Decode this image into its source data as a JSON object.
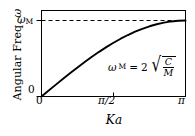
{
  "chart_data": {
    "type": "line",
    "title": "",
    "xlabel": "Ka",
    "ylabel": "Angular Freq. ω",
    "ylabel_text": "Angular Freq.",
    "ylabel_symbol": "ω",
    "xlim": [
      0,
      3.14159
    ],
    "ylim": [
      0,
      1
    ],
    "grid": false,
    "legend": null,
    "xticks": [
      {
        "value": 0,
        "label": "0"
      },
      {
        "value": 1.5708,
        "label": "π/2"
      },
      {
        "value": 3.14159,
        "label": "π"
      }
    ],
    "yticks": [
      {
        "value": 0,
        "label": "0"
      },
      {
        "value": 1,
        "label": "ω",
        "sub": "M"
      }
    ],
    "series": [
      {
        "name": "dispersion",
        "equation": "ω = ω_M sin(Ka/2)",
        "color": "#000000",
        "x": [
          0.0,
          0.15708,
          0.31416,
          0.47124,
          0.62832,
          0.7854,
          0.94248,
          1.09956,
          1.25664,
          1.41372,
          1.5708,
          1.72788,
          1.88496,
          2.04204,
          2.19911,
          2.35619,
          2.51327,
          2.67035,
          2.82743,
          2.98451,
          3.14159
        ],
        "y": [
          0.0,
          0.0785,
          0.1564,
          0.2334,
          0.309,
          0.3827,
          0.454,
          0.5225,
          0.5878,
          0.6494,
          0.7071,
          0.7604,
          0.809,
          0.8526,
          0.891,
          0.9239,
          0.9511,
          0.9724,
          0.9877,
          0.9969,
          1.0
        ]
      }
    ],
    "reference_lines": [
      {
        "name": "omega-max-asymptote",
        "orientation": "horizontal",
        "value": 1,
        "style": "dashed",
        "color": "#000000"
      }
    ],
    "annotations": [
      {
        "name": "omega-max-formula",
        "symbol": "ω",
        "subscript": "M",
        "equals": "=",
        "coefficient": "2",
        "radical_numerator": "C",
        "radical_denominator": "M",
        "text": "ω_M = 2√(C/M)"
      }
    ]
  }
}
